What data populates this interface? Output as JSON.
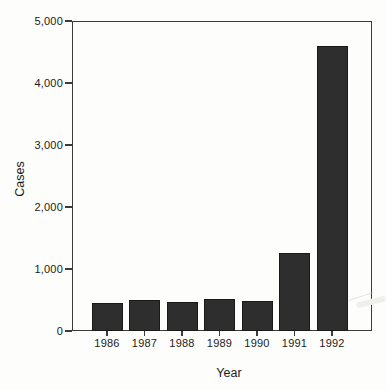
{
  "figure": {
    "background_color": "#fdfdfc",
    "frame_color": "#3b3b3b",
    "text_color": "#1b1b1b"
  },
  "chart_data": {
    "type": "bar",
    "title": "",
    "xlabel": "Year",
    "ylabel": "Cases",
    "categories": [
      "1986",
      "1987",
      "1988",
      "1989",
      "1990",
      "1991",
      "1992"
    ],
    "values": [
      450,
      500,
      460,
      510,
      490,
      1260,
      4600
    ],
    "ylim": [
      0,
      5000
    ],
    "yticks": [
      0,
      1000,
      2000,
      3000,
      4000,
      5000
    ],
    "ytick_labels": [
      "0",
      "1,000",
      "2,000",
      "3,000",
      "4,000",
      "5,000"
    ],
    "grid": false,
    "legend": false,
    "bar_color": "#2e2e2e",
    "bar_edge_color": "#191919"
  }
}
